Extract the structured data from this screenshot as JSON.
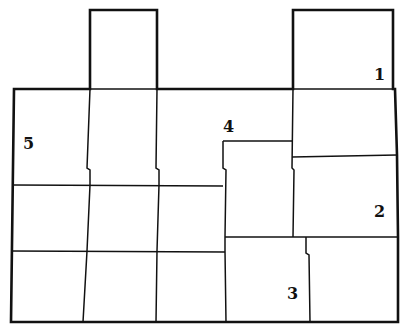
{
  "diagram": {
    "type": "region-map",
    "stroke_color": "#111111",
    "background": "#ffffff",
    "labels": [
      {
        "id": "1",
        "text": "1",
        "x": 374,
        "y": 67
      },
      {
        "id": "2",
        "text": "2",
        "x": 374,
        "y": 204
      },
      {
        "id": "3",
        "text": "3",
        "x": 287,
        "y": 286
      },
      {
        "id": "4",
        "text": "4",
        "x": 223,
        "y": 119
      },
      {
        "id": "5",
        "text": "5",
        "x": 23,
        "y": 136
      }
    ]
  }
}
